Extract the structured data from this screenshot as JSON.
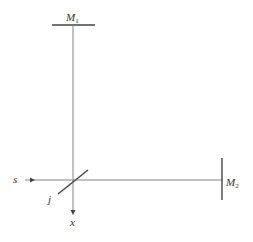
{
  "diagram": {
    "labels": {
      "mirror1": "M",
      "mirror1_sub": "1",
      "mirror2": "M",
      "mirror2_sub": "2",
      "source": "s",
      "splitter": "j",
      "output": "x"
    },
    "colors": {
      "line": "#555555",
      "text": "#333333",
      "background": "#ffffff"
    }
  }
}
